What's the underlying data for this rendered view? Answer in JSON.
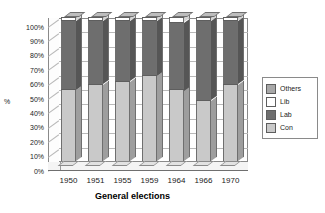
{
  "chart_data": {
    "type": "bar",
    "subtype": "stacked-column-3d",
    "title": "",
    "xlabel": "General elections",
    "ylabel": "%",
    "categories": [
      "1950",
      "1951",
      "1955",
      "1959",
      "1964",
      "1966",
      "1970"
    ],
    "ylim": [
      0,
      100
    ],
    "ytick_labels": [
      "0%",
      "10%",
      "20%",
      "30%",
      "40%",
      "50%",
      "60%",
      "70%",
      "80%",
      "90%",
      "100%"
    ],
    "ytick_values": [
      0,
      10,
      20,
      30,
      40,
      50,
      60,
      70,
      80,
      90,
      100
    ],
    "grid": true,
    "legend_position": "right",
    "stack_order_bottom_to_top": [
      "Con",
      "Lab",
      "Lib",
      "Others"
    ],
    "series": [
      {
        "name": "Con",
        "color": "#c9c9c9",
        "values": [
          49,
          53,
          55,
          59,
          49,
          42,
          53
        ]
      },
      {
        "name": "Lab",
        "color": "#6e6e6e",
        "values": [
          48,
          44,
          42,
          38,
          47,
          55,
          44
        ]
      },
      {
        "name": "Lib",
        "color": "#ffffff",
        "values": [
          2,
          2,
          2,
          2,
          3,
          2,
          2
        ]
      },
      {
        "name": "Others",
        "color": "#a8a8a8",
        "values": [
          1,
          1,
          1,
          1,
          1,
          1,
          1
        ]
      }
    ],
    "legend_entries": [
      {
        "label": "Others",
        "color": "#a8a8a8"
      },
      {
        "label": "Lib",
        "color": "#ffffff"
      },
      {
        "label": "Lab",
        "color": "#6e6e6e"
      },
      {
        "label": "Con",
        "color": "#c9c9c9"
      }
    ]
  }
}
